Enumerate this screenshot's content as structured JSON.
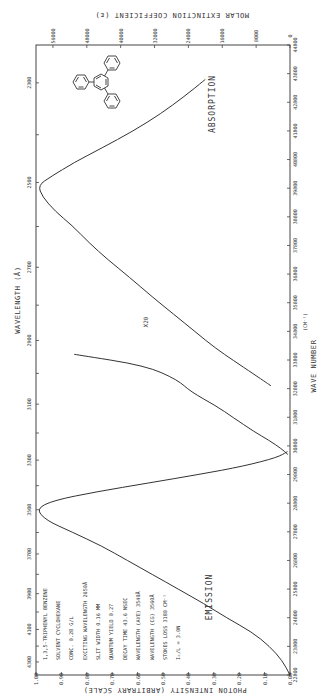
{
  "chart_data": {
    "type": "line",
    "orientation": "rotated 90deg clockwise (landscape figure printed on portrait page)",
    "axes": {
      "wavelength": {
        "label": "WAVELENGTH (Å)",
        "ticks": [
          2300,
          2500,
          2700,
          2900,
          3100,
          3300,
          3500,
          3700,
          3900,
          4100,
          4300
        ]
      },
      "wave_number": {
        "label": "WAVE NUMBER (CM⁻¹)",
        "ticks": [
          44800,
          43800,
          42800,
          41800,
          40800,
          39800,
          38800,
          37800,
          36800,
          35800,
          34800,
          33800,
          32800,
          31800,
          30800,
          29800,
          28800,
          27800,
          26800,
          25800,
          24800,
          23800,
          22800
        ],
        "range": [
          22800,
          44800
        ]
      },
      "molar_extinction": {
        "label": "MOLAR EXTINCTION COEFFICIENT (ε)",
        "ticks": [
          0,
          8000,
          16000,
          24000,
          32000,
          40000,
          48000,
          56000
        ],
        "range": [
          0,
          60000
        ]
      },
      "photon_intensity": {
        "label": "PHOTON INTENSITY (ARBITRARY SCALE)",
        "ticks": [
          "0.00",
          "0.10",
          "0.20",
          "0.30",
          "0.40",
          "0.50",
          "0.60",
          "0.70",
          "0.80",
          "0.90",
          "1.00"
        ],
        "range": [
          0,
          1.0
        ]
      }
    },
    "series": [
      {
        "name": "ABSORPTION",
        "x_unit": "wave number (cm-1)",
        "y_unit": "molar extinction coefficient",
        "points": [
          [
            43600,
            20000
          ],
          [
            43000,
            25000
          ],
          [
            42400,
            30500
          ],
          [
            41800,
            37000
          ],
          [
            41200,
            44500
          ],
          [
            40700,
            51000
          ],
          [
            40200,
            56500
          ],
          [
            39900,
            59500
          ],
          [
            39500,
            58500
          ],
          [
            39000,
            55500
          ],
          [
            38500,
            51500
          ],
          [
            37900,
            47500
          ],
          [
            37300,
            43000
          ],
          [
            36700,
            38000
          ],
          [
            36000,
            32500
          ],
          [
            35400,
            27500
          ],
          [
            34800,
            22500
          ],
          [
            34200,
            17500
          ],
          [
            33800,
            13500
          ],
          [
            33300,
            8500
          ],
          [
            33000,
            5500
          ],
          [
            32900,
            4500
          ]
        ]
      },
      {
        "name": "X20 (absorption tail ×20)",
        "x_unit": "wave number (cm-1)",
        "y_unit": "molar extinction coefficient (×20)",
        "points": [
          [
            34000,
            51000
          ],
          [
            33600,
            34000
          ],
          [
            33100,
            26500
          ],
          [
            32700,
            23500
          ],
          [
            32200,
            17500
          ],
          [
            31800,
            13500
          ],
          [
            31300,
            8500
          ],
          [
            31000,
            5000
          ],
          [
            30700,
            2000
          ],
          [
            30500,
            500
          ]
        ]
      },
      {
        "name": "EMISSION",
        "x_unit": "wave number (cm-1)",
        "y_unit": "photon intensity",
        "points": [
          [
            30600,
            0.01
          ],
          [
            30400,
            0.05
          ],
          [
            30100,
            0.18
          ],
          [
            29800,
            0.36
          ],
          [
            29500,
            0.56
          ],
          [
            29200,
            0.76
          ],
          [
            28900,
            0.93
          ],
          [
            28600,
            1.0
          ],
          [
            28200,
            0.96
          ],
          [
            27800,
            0.86
          ],
          [
            27300,
            0.74
          ],
          [
            26800,
            0.64
          ],
          [
            26300,
            0.54
          ],
          [
            25800,
            0.44
          ],
          [
            25300,
            0.34
          ],
          [
            24800,
            0.25
          ],
          [
            24300,
            0.15
          ],
          [
            23800,
            0.08
          ],
          [
            23300,
            0.03
          ],
          [
            22800,
            0.0
          ]
        ]
      }
    ],
    "annotations": [
      "ABSORPTION",
      "EMISSION",
      "X20"
    ]
  },
  "labels": {
    "top_axis_title": "MOLAR EXTINCTION COEFFICIENT (ε)",
    "bottom_axis_title": "PHOTON INTENSITY (ARBITRARY SCALE)",
    "left_axis_title": "WAVELENGTH (Å)",
    "right_axis_title_1": "WAVE NUMBER",
    "right_axis_title_2": "(CM⁻¹)",
    "absorption": "ABSORPTION",
    "emission": "EMISSION",
    "x20": "X20"
  },
  "notes": [
    "1,3,5-TRIPHENYL BENZENE",
    "SOLVENT  CYCLOHEXANE",
    "CONC.  0.28 G/L",
    "EXCITING WAVELENGTH  2650Å",
    "SLIT WIDTH  0.16 MM",
    "QUANTUM YIELD  0.27",
    "DECAY TIME  43.6 NSEC",
    "WAVELENGTH (AVE)  3540Å",
    "WAVELENGTH (CG)  3560Å",
    "STOKES LOSS  3180 CM⁻¹",
    "I₀/L = 3.0N"
  ],
  "ticks": {
    "top": [
      "56000",
      "48000",
      "40000",
      "32000",
      "24000",
      "16000",
      "8000",
      "0"
    ],
    "bottom": [
      "1.00",
      "0.90",
      "0.80",
      "0.70",
      "0.60",
      "0.50",
      "0.40",
      "0.30",
      "0.20",
      "0.10",
      "0.00"
    ],
    "left": [
      "2300",
      "2500",
      "2700",
      "2900",
      "3100",
      "3300",
      "3500",
      "3700",
      "3900",
      "4100",
      "4300"
    ],
    "right": [
      "44800",
      "43800",
      "42800",
      "41800",
      "40800",
      "39800",
      "38800",
      "37800",
      "36800",
      "35800",
      "34800",
      "33800",
      "32800",
      "31800",
      "30800",
      "29800",
      "28800",
      "27800",
      "26800",
      "25800",
      "24800",
      "23800",
      "22800"
    ]
  }
}
